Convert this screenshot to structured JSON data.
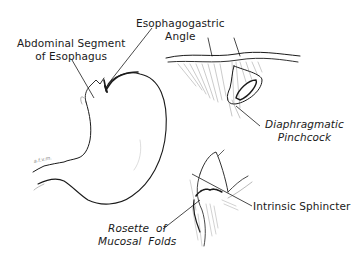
{
  "diagram": {
    "type": "anatomical-illustration",
    "labels": {
      "abdominal_segment": {
        "line1": "Abdominal Segment",
        "line2": "of Esophagus"
      },
      "esophagogastric_angle": {
        "line1": "Esophagogastric",
        "line2": "Angle"
      },
      "diaphragmatic_pinchcock": {
        "line1": "Diaphragmatic",
        "line2": "Pinchcock"
      },
      "intrinsic_sphincter": {
        "line1": "Intrinsic Sphincter"
      },
      "rosette": {
        "line1": "Rosette  of",
        "line2": "Mucosal  Folds"
      }
    },
    "figures": [
      "stomach-outline",
      "diaphragm-hiatus",
      "cardia-cutaway"
    ],
    "signature": "a.f.v.m.",
    "colors": {
      "ink": "#1a1a1a",
      "hatch": "#8a8a8a",
      "background": "#ffffff"
    }
  }
}
